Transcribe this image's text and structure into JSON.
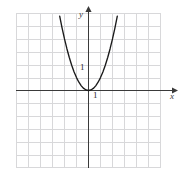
{
  "figure": {
    "name": "parabola-graph",
    "background": "#ffffff",
    "width": 181,
    "height": 176
  },
  "labels": {
    "y_axis": "y",
    "x_axis": "x",
    "y_unit_tick": "1",
    "x_unit_tick": "1"
  },
  "colors": {
    "grid_minor": "#d8d8da",
    "grid_major": "#b9b9bd",
    "axis": "#3a3a3a",
    "curve": "#1a1a1a",
    "text": "#2b2b2b"
  },
  "chart_data": {
    "type": "line",
    "title": "",
    "subtitle": "",
    "xlabel": "x",
    "ylabel": "y",
    "function": "y = x^2",
    "grid": true,
    "grid_step": 1,
    "legend": null,
    "annotations": [
      {
        "text": "1",
        "x": 0,
        "y": 1,
        "role": "y-axis unit tick"
      },
      {
        "text": "1",
        "x": 1,
        "y": 0,
        "role": "x-axis unit tick"
      }
    ],
    "xlim": [
      -6.1,
      6.2
    ],
    "ylim": [
      -6.4,
      6.4
    ],
    "axis_arrows": {
      "x_positive": true,
      "y_positive": true
    },
    "series": [
      {
        "name": "y = x^2",
        "color": "#1a1a1a",
        "x": [
          -2.55,
          -2.4,
          -2.2,
          -2.0,
          -1.8,
          -1.6,
          -1.4,
          -1.2,
          -1.0,
          -0.8,
          -0.6,
          -0.4,
          -0.2,
          0.0,
          0.2,
          0.4,
          0.6,
          0.8,
          1.0,
          1.2,
          1.4,
          1.6,
          1.8,
          2.0,
          2.2,
          2.4,
          2.55
        ],
        "values": [
          6.5,
          5.76,
          4.84,
          4.0,
          3.24,
          2.56,
          1.96,
          1.44,
          1.0,
          0.64,
          0.36,
          0.16,
          0.04,
          0.0,
          0.04,
          0.16,
          0.36,
          0.64,
          1.0,
          1.44,
          1.96,
          2.56,
          3.24,
          4.0,
          4.84,
          5.76,
          6.5
        ]
      }
    ]
  }
}
